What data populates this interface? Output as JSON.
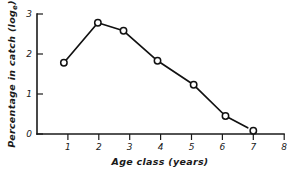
{
  "chart_data": {
    "type": "line",
    "title": "",
    "xlabel": "Age class (years)",
    "ylabel": "Percentage in catch (log e)",
    "ylabel_main": "Percentage in catch (log",
    "ylabel_sub": "e",
    "ylabel_close": ")",
    "x": [
      0.87,
      1.97,
      2.8,
      3.9,
      5.07,
      6.1,
      7.0
    ],
    "values": [
      1.78,
      2.78,
      2.58,
      1.83,
      1.23,
      0.45,
      0.08
    ],
    "series": [
      {
        "name": "Percentage in catch",
        "points": [
          {
            "x": 0.87,
            "y": 1.78
          },
          {
            "x": 1.97,
            "y": 2.78
          },
          {
            "x": 2.8,
            "y": 2.58
          },
          {
            "x": 3.9,
            "y": 1.83
          },
          {
            "x": 5.07,
            "y": 1.23
          },
          {
            "x": 6.1,
            "y": 0.45
          },
          {
            "x": 7.0,
            "y": 0.08
          }
        ]
      }
    ],
    "line_end": {
      "x": 6.95,
      "y": 0.07
    },
    "line_segment_last_drawn_to": {
      "x": 6.95,
      "y": 0.07
    },
    "xlim": [
      0,
      8
    ],
    "ylim": [
      0,
      3
    ],
    "xticks": [
      0,
      1,
      2,
      3,
      4,
      5,
      6,
      7,
      8
    ],
    "xtick_labels": [
      "0",
      "1",
      "2",
      "3",
      "4",
      "5",
      "6",
      "7",
      "8"
    ],
    "yticks": [
      0,
      1,
      2,
      3
    ],
    "ytick_labels": [
      "0",
      "1",
      "2",
      "3"
    ],
    "grid": false,
    "legend": null,
    "marker": "open-circle",
    "marker_fill": "#ffffff",
    "line_color": "#111111",
    "axis_color": "#1a1a1a",
    "background": "#ffffff"
  },
  "axes": {
    "x_axis_label": "Age class (years)",
    "y_axis_label": "Percentage in catch (log e)"
  }
}
